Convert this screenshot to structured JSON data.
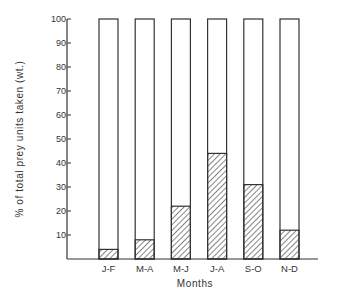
{
  "chart_data": {
    "type": "bar",
    "subtype": "stacked-100-percent",
    "title": "",
    "xlabel": "Months",
    "ylabel": "% of total prey units taken (wt.)",
    "categories": [
      "J-F",
      "M-A",
      "M-J",
      "J-A",
      "S-O",
      "N-D"
    ],
    "series": [
      {
        "name": "hatched",
        "pattern": "diagonal-hatch",
        "values": [
          4,
          8,
          22,
          44,
          31,
          12
        ]
      },
      {
        "name": "remainder",
        "pattern": "none",
        "values": [
          96,
          92,
          78,
          56,
          69,
          88
        ]
      }
    ],
    "ylim": [
      0,
      100
    ],
    "yticks": [
      10,
      20,
      30,
      40,
      50,
      60,
      70,
      80,
      90,
      100
    ],
    "grid": false,
    "legend": null
  },
  "labels": {
    "xlabel": "Months",
    "ylabel": "% of total prey units taken (wt.)"
  },
  "colors": {
    "ink": "#333333",
    "background": "#ffffff"
  }
}
